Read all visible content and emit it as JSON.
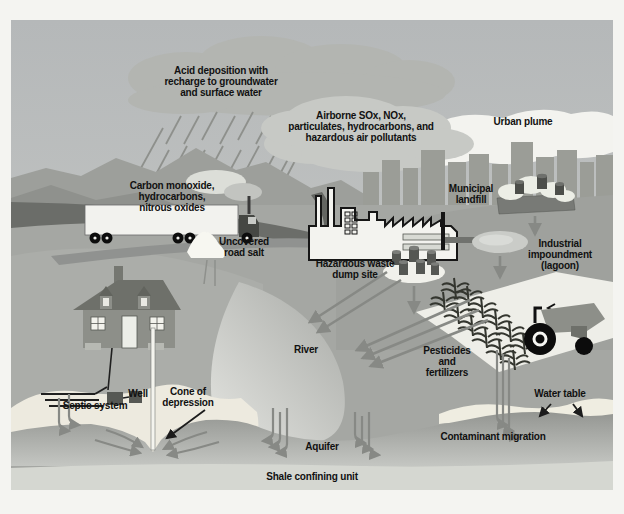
{
  "figure": {
    "subject": "Sources of groundwater contamination diagram"
  },
  "labels": {
    "acid_deposition": "Acid deposition with\nrecharge to groundwater\nand surface water",
    "airborne_pollutants": "Airborne SOx, NOx,\nparticulates, hydrocarbons, and\nhazardous air pollutants",
    "urban_plume": "Urban plume",
    "vehicle_emissions": "Carbon monoxide,\nhydrocarbons,\nnitrous oxides",
    "municipal_landfill": "Municipal\nlandfill",
    "uncovered_road_salt": "Uncovered\nroad salt",
    "hazardous_waste_dump": "Hazardous waste\ndump site",
    "industrial_impoundment": "Industrial\nimpoundment\n(lagoon)",
    "river": "River",
    "pesticides_fertilizers": "Pesticides\nand\nfertilizers",
    "water_table": "Water table",
    "contaminant_migration": "Contaminant migration",
    "aquifer": "Aquifer",
    "shale_confining_unit": "Shale confining unit",
    "septic_system": "Septic system",
    "well": "Well",
    "cone_of_depression": "Cone of\ndepression"
  },
  "colors": {
    "page_background": "#f4f4f1",
    "sky_top": "#b5b8b9",
    "sky_bottom": "#c9cbc8",
    "cloud_gray": "#b3b5b1",
    "light_cloud": "#c7c9c5",
    "urban_plume_white": "#f3f3ef",
    "mountain": "#9d9f9b",
    "land": "#a5a7a3",
    "road_dark": "#6b6d69",
    "unsaturated_cream": "#edeadf",
    "aquifer_gray": "#9b9d99",
    "shale_light": "#d5d7d1",
    "flow_arrow": "#878985",
    "pointer_arrow": "#1c1c1c",
    "text": "#111111"
  }
}
